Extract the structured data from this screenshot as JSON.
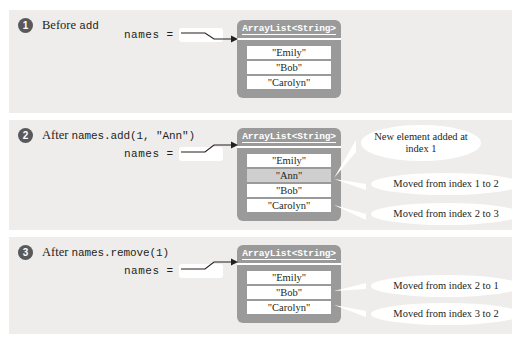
{
  "figure": {
    "background_color": "#ffffff",
    "panel_color": "#efedeb",
    "object_color": "#9a9a9a",
    "badge_color": "#58595b",
    "highlight_color": "#cfcfcf"
  },
  "panels": [
    {
      "number": "1",
      "title_prefix": "Before ",
      "title_code": "add",
      "variable": {
        "label": "names =",
        "value": ""
      },
      "object": {
        "type_label": "ArrayList<String>",
        "cells": [
          {
            "value": "\"Emily\"",
            "highlighted": false
          },
          {
            "value": "\"Bob\"",
            "highlighted": false
          },
          {
            "value": "\"Carolyn\"",
            "highlighted": false
          }
        ]
      },
      "callouts": []
    },
    {
      "number": "2",
      "title_prefix": "After ",
      "title_code": "names.add(1, \"Ann\")",
      "variable": {
        "label": "names =",
        "value": ""
      },
      "object": {
        "type_label": "ArrayList<String>",
        "cells": [
          {
            "value": "\"Emily\"",
            "highlighted": false
          },
          {
            "value": "\"Ann\"",
            "highlighted": true
          },
          {
            "value": "\"Bob\"",
            "highlighted": false
          },
          {
            "value": "\"Carolyn\"",
            "highlighted": false
          }
        ]
      },
      "callouts": [
        {
          "text": "New element added at index 1"
        },
        {
          "text": "Moved from index 1 to 2"
        },
        {
          "text": "Moved from index 2 to 3"
        }
      ]
    },
    {
      "number": "3",
      "title_prefix": "After ",
      "title_code": "names.remove(1)",
      "variable": {
        "label": "names =",
        "value": ""
      },
      "object": {
        "type_label": "ArrayList<String>",
        "cells": [
          {
            "value": "\"Emily\"",
            "highlighted": false
          },
          {
            "value": "\"Bob\"",
            "highlighted": false
          },
          {
            "value": "\"Carolyn\"",
            "highlighted": false
          }
        ]
      },
      "callouts": [
        {
          "text": "Moved from index 2 to 1"
        },
        {
          "text": "Moved from index 3 to 2"
        }
      ]
    }
  ]
}
